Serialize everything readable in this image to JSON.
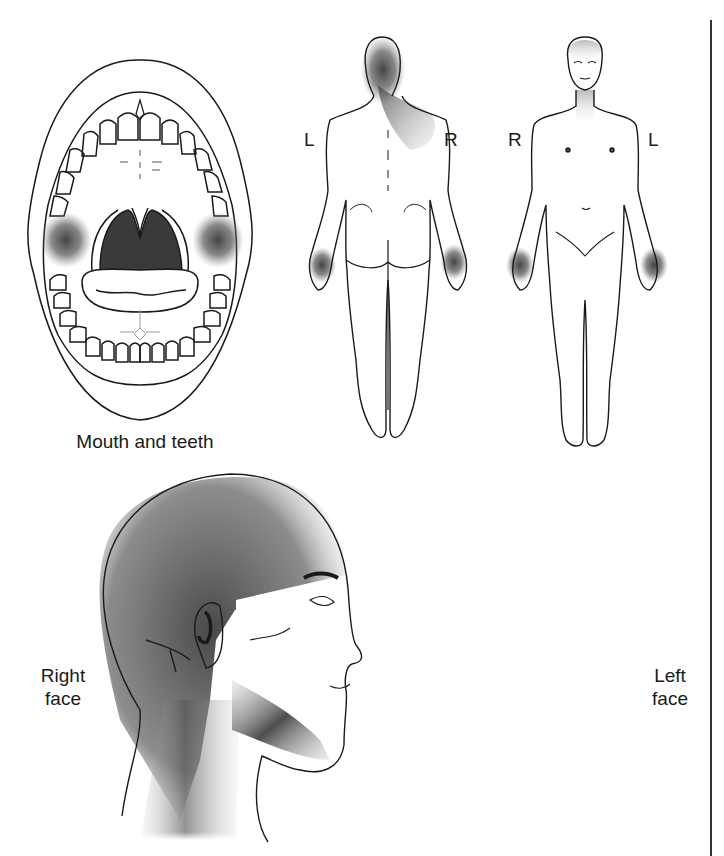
{
  "figure": {
    "type": "pain referral pattern diagram",
    "shading_color": "#3a3a3a",
    "line_color": "#1a1a1a",
    "background": "#ffffff"
  },
  "panels": {
    "mouth": {
      "caption": "Mouth and teeth",
      "shaded_regions": [
        "left cheek inner",
        "right cheek inner"
      ]
    },
    "body_back": {
      "view": "posterior",
      "left_label": "L",
      "right_label": "R",
      "shaded_regions": [
        "back of head",
        "right neck and shoulder",
        "both hands"
      ]
    },
    "body_front": {
      "view": "anterior",
      "left_label": "R",
      "right_label": "L",
      "shaded_regions": [
        "forehead",
        "neck",
        "both hands"
      ]
    },
    "right_face": {
      "caption_line1": "Right",
      "caption_line2": "face",
      "shaded_regions": [
        "scalp",
        "jaw",
        "neck"
      ]
    },
    "left_face": {
      "caption_line1": "Left",
      "caption_line2": "face",
      "shaded_regions": [
        "scalp",
        "jaw",
        "neck"
      ]
    }
  }
}
